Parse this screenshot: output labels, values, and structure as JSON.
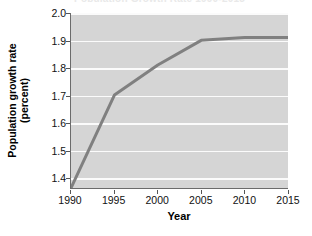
{
  "figure": {
    "title_remnant": "Population Growth Rate 1990-2015",
    "background_color": "#ffffff"
  },
  "axes": {
    "ylabel_line1": "Population growth rate",
    "ylabel_line2": "(percent)",
    "xlabel": "Year",
    "yticks": [
      "1.4",
      "1.5",
      "1.6",
      "1.7",
      "1.8",
      "1.9",
      "2.0"
    ],
    "xticks": [
      "1990",
      "1995",
      "2000",
      "2005",
      "2010",
      "2015"
    ],
    "plot_background_color": "#d5d5d5",
    "gridline_color": "#fbfbfb",
    "axis_color": "#6b6b6b"
  },
  "chart_data": {
    "type": "line",
    "title": "",
    "xlabel": "Year",
    "ylabel": "Population growth rate (percent)",
    "xlim": [
      1990,
      2015
    ],
    "ylim": [
      1.36,
      2.0
    ],
    "ytick_values": [
      1.4,
      1.5,
      1.6,
      1.7,
      1.8,
      1.9,
      2.0
    ],
    "xtick_values": [
      1990,
      1995,
      2000,
      2005,
      2010,
      2015
    ],
    "grid": "horizontal",
    "legend": "none",
    "line_color": "#808080",
    "line_width": 3,
    "x": [
      1990,
      1995,
      2000,
      2005,
      2010,
      2015
    ],
    "values": [
      1.36,
      1.7,
      1.81,
      1.9,
      1.91,
      1.91
    ],
    "series": [
      {
        "name": "Population growth rate",
        "x": [
          1990,
          1995,
          2000,
          2005,
          2010,
          2015
        ],
        "values": [
          1.36,
          1.7,
          1.81,
          1.9,
          1.91,
          1.91
        ]
      }
    ]
  }
}
